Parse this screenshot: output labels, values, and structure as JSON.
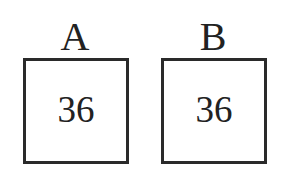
{
  "diagram": {
    "boxes": [
      {
        "label": "A",
        "value": "36"
      },
      {
        "label": "B",
        "value": "36"
      }
    ],
    "colors": {
      "border": "#2a2a2a",
      "text": "#222222",
      "background": "#ffffff"
    }
  }
}
